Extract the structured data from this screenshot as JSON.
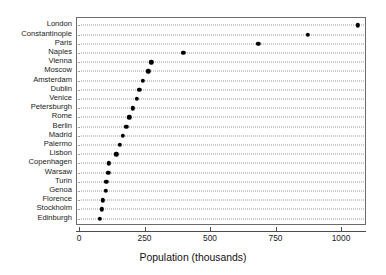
{
  "chart_data": {
    "type": "scatter",
    "title": "",
    "subtitle": "",
    "xlabel": "Population (thousands)",
    "ylabel": "",
    "xlim": [
      0,
      1130
    ],
    "ylim": null,
    "grid": "horizontal-dotted",
    "legend": null,
    "orientation": "horizontal-dotplot",
    "xticks": [
      0,
      250,
      500,
      750,
      1000
    ],
    "xticklabels": [
      "0",
      "250",
      "500",
      "750",
      "1000"
    ],
    "categories": [
      "London",
      "Constantinople",
      "Paris",
      "Naples",
      "Vienna",
      "Moscow",
      "Amsterdam",
      "Dublin",
      "Venice",
      "Petersburgh",
      "Rome",
      "Berlin",
      "Madrid",
      "Palermo",
      "Lisbon",
      "Copenhagen",
      "Warsaw",
      "Turin",
      "Genoa",
      "Florence",
      "Stockholm",
      "Edinburgh"
    ],
    "values": [
      1060,
      870,
      680,
      395,
      272,
      260,
      240,
      226,
      217,
      202,
      188,
      176,
      163,
      152,
      139,
      111,
      108,
      101,
      98,
      88,
      83,
      75
    ],
    "marker": "filled-circle",
    "marker_color": "#000000"
  },
  "axis": {
    "x_title": "Population (thousands)"
  }
}
